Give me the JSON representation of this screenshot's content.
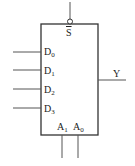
{
  "diagram": {
    "type": "4-to-1 multiplexer",
    "enable": {
      "name": "S",
      "inverted": true,
      "label": "S"
    },
    "inputs": [
      {
        "base": "D",
        "sub": "0"
      },
      {
        "base": "D",
        "sub": "1"
      },
      {
        "base": "D",
        "sub": "2"
      },
      {
        "base": "D",
        "sub": "3"
      }
    ],
    "selects": [
      {
        "base": "A",
        "sub": "1"
      },
      {
        "base": "A",
        "sub": "0"
      }
    ],
    "output": {
      "label": "Y"
    },
    "colors": {
      "line": "#555555",
      "box": "#333333",
      "text": "#222222",
      "background": "#ffffff"
    }
  }
}
